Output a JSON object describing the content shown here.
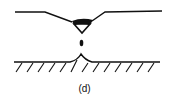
{
  "figure": {
    "label": "(d)",
    "stroke_color": "#111111",
    "background": "#ffffff",
    "elements": {
      "upper_surface": "deformed upper surface with central depression",
      "pendant_drop": "triangular liquid drop hanging from upper surface",
      "detached_droplet": "small detached droplet in gap",
      "lower_cone": "liquid cone rising from lower surface",
      "substrate": "hatched solid substrate"
    }
  }
}
